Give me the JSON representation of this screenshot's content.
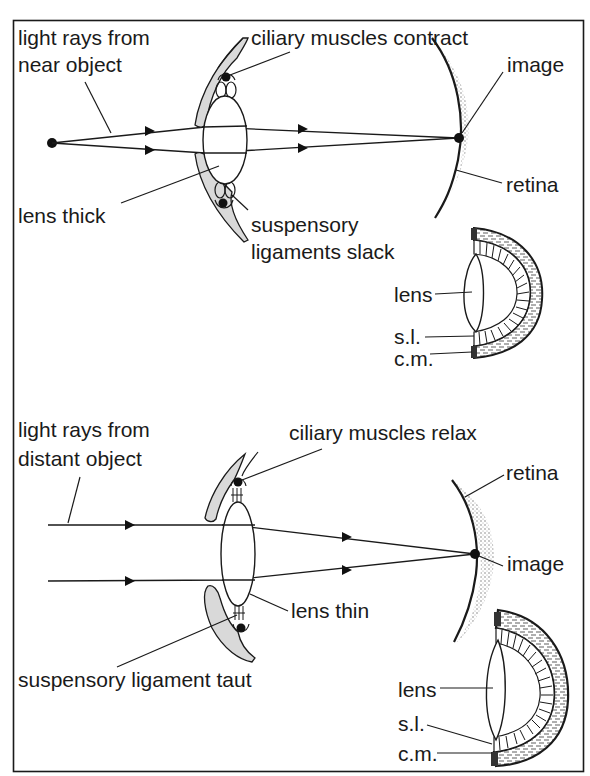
{
  "near_panel": {
    "labels": {
      "light_rays": [
        "light rays from",
        "near object"
      ],
      "ciliary": "ciliary muscles contract",
      "image": "image",
      "retina": "retina",
      "lens_state": "lens thick",
      "suspensory": [
        "suspensory",
        "ligaments slack"
      ]
    },
    "inset": {
      "lens": "lens",
      "sl": "s.l.",
      "cm": "c.m."
    }
  },
  "distant_panel": {
    "labels": {
      "light_rays": [
        "light rays from",
        "distant object"
      ],
      "ciliary": "ciliary muscles relax",
      "retina": "retina",
      "image": "image",
      "lens_state": "lens thin",
      "suspensory": "suspensory ligament taut"
    },
    "inset": {
      "lens": "lens",
      "sl": "s.l.",
      "cm": "c.m."
    }
  },
  "colors": {
    "ink": "#1a1a1a",
    "tissue_shading": "#d9d9d9",
    "background": "#ffffff"
  }
}
